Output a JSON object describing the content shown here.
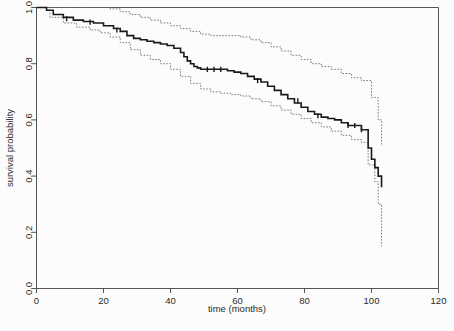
{
  "figure": {
    "background_color": "#fcfcfc",
    "width": 454,
    "height": 331
  },
  "chart_data": {
    "type": "line",
    "subtype": "kaplan-meier-survival-curve",
    "title": "",
    "xlabel": "time (months)",
    "ylabel": "survival probability",
    "xlim": [
      0,
      120
    ],
    "ylim": [
      0.0,
      1.0
    ],
    "xticks": [
      0,
      20,
      40,
      60,
      80,
      100,
      120
    ],
    "xticklabels": [
      "0",
      "20",
      "40",
      "60",
      "80",
      "100",
      "120"
    ],
    "yticks": [
      0.0,
      0.2,
      0.4,
      0.6,
      0.8,
      1.0
    ],
    "yticklabels": [
      "0.0",
      "0.2",
      "0.4",
      "0.6",
      "0.8",
      "1.0"
    ],
    "grid": false,
    "legend": false,
    "legend_position": "none",
    "colors": {
      "estimate": "#1a1a1a",
      "confidence_band": "#6e6e6e",
      "axis": "#555555"
    },
    "series": [
      {
        "name": "survival estimate",
        "style": "solid",
        "step": "post",
        "x": [
          0,
          3,
          5,
          8,
          11,
          14,
          17,
          20,
          23,
          25,
          27,
          29,
          31,
          33,
          35,
          37,
          39,
          41,
          43,
          44,
          45,
          46,
          47,
          48,
          49,
          51,
          53,
          55,
          57,
          59,
          61,
          63,
          65,
          67,
          69,
          71,
          73,
          75,
          77,
          79,
          81,
          83,
          85,
          87,
          89,
          91,
          93,
          97,
          99,
          100,
          101,
          102,
          103
        ],
        "y": [
          1.0,
          0.99,
          0.975,
          0.965,
          0.955,
          0.95,
          0.945,
          0.935,
          0.925,
          0.915,
          0.9,
          0.89,
          0.885,
          0.88,
          0.875,
          0.87,
          0.865,
          0.855,
          0.84,
          0.825,
          0.81,
          0.8,
          0.79,
          0.785,
          0.78,
          0.78,
          0.78,
          0.78,
          0.775,
          0.77,
          0.765,
          0.755,
          0.745,
          0.735,
          0.72,
          0.705,
          0.69,
          0.675,
          0.66,
          0.645,
          0.63,
          0.62,
          0.61,
          0.605,
          0.6,
          0.59,
          0.58,
          0.565,
          0.5,
          0.46,
          0.43,
          0.4,
          0.36
        ]
      },
      {
        "name": "upper 95% confidence limit",
        "style": "dotted",
        "step": "post",
        "x": [
          0,
          6,
          12,
          18,
          22,
          25,
          28,
          31,
          34,
          37,
          40,
          43,
          46,
          49,
          52,
          55,
          58,
          61,
          64,
          67,
          70,
          73,
          76,
          79,
          82,
          85,
          88,
          91,
          94,
          97,
          100,
          102,
          103
        ],
        "y": [
          1.0,
          1.0,
          1.0,
          1.0,
          0.995,
          0.985,
          0.975,
          0.965,
          0.955,
          0.945,
          0.935,
          0.925,
          0.915,
          0.905,
          0.9,
          0.9,
          0.9,
          0.895,
          0.885,
          0.875,
          0.86,
          0.845,
          0.83,
          0.815,
          0.8,
          0.79,
          0.78,
          0.765,
          0.75,
          0.74,
          0.68,
          0.6,
          0.51
        ]
      },
      {
        "name": "lower 95% confidence limit",
        "style": "dotted",
        "step": "post",
        "x": [
          0,
          4,
          8,
          12,
          16,
          19,
          22,
          25,
          28,
          31,
          34,
          37,
          40,
          43,
          46,
          49,
          52,
          55,
          58,
          61,
          64,
          67,
          70,
          73,
          76,
          79,
          82,
          85,
          88,
          91,
          94,
          97,
          99,
          101,
          102,
          103
        ],
        "y": [
          1.0,
          0.965,
          0.945,
          0.93,
          0.92,
          0.91,
          0.895,
          0.875,
          0.85,
          0.83,
          0.815,
          0.8,
          0.78,
          0.755,
          0.73,
          0.71,
          0.7,
          0.695,
          0.69,
          0.685,
          0.675,
          0.665,
          0.65,
          0.635,
          0.62,
          0.605,
          0.59,
          0.575,
          0.56,
          0.545,
          0.53,
          0.52,
          0.44,
          0.38,
          0.3,
          0.15
        ]
      }
    ],
    "censoring_marks": {
      "series": "survival estimate",
      "x": [
        9,
        16,
        24,
        51,
        53,
        55,
        66,
        78,
        84,
        93,
        95,
        97
      ],
      "y": [
        0.96,
        0.948,
        0.92,
        0.78,
        0.78,
        0.78,
        0.74,
        0.668,
        0.615,
        0.58,
        0.58,
        0.565
      ]
    },
    "annotations": []
  }
}
